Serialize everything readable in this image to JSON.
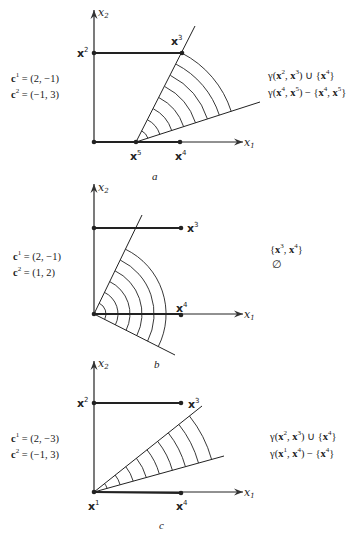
{
  "panels": [
    {
      "id": "a",
      "caption": "a",
      "costs": {
        "c1": "(2, −1)",
        "c2": "(−1, 3)"
      },
      "result_lines": [
        "γ(x², x³) ∪ {x⁴}",
        "γ(x⁴, x⁵) − {x⁴, x⁵}"
      ],
      "points": [
        "x2",
        "x3",
        "x4",
        "x5"
      ],
      "cone_apex": "x5",
      "arc_count": 8
    },
    {
      "id": "b",
      "caption": "b",
      "costs": {
        "c1": "(2, −1)",
        "c2": "(1, 2)"
      },
      "result_lines": [
        "{x³, x⁴}",
        "∅"
      ],
      "points": [
        "x3",
        "x4"
      ],
      "cone_apex": "origin",
      "arc_count": 6
    },
    {
      "id": "c",
      "caption": "c",
      "costs": {
        "c1": "(2, −3)",
        "c2": "(−1, 3)"
      },
      "result_lines": [
        "γ(x², x³) ∪ {x⁴}",
        "γ(x¹, x⁴) − {x⁴}"
      ],
      "points": [
        "x1",
        "x2",
        "x3",
        "x4"
      ],
      "cone_apex": "x1",
      "arc_count": 9
    }
  ],
  "axes": {
    "x_label": "x",
    "x_sub": "1",
    "y_label": "x",
    "y_sub": "2"
  },
  "text": {
    "c": "c",
    "eq": " = ",
    "x": "x",
    "s1": "1",
    "s2": "2",
    "s3": "3",
    "s4": "4",
    "s5": "5",
    "gamma": "γ",
    "a_r1_pre": "γ(",
    "a_r1_mid": ", ",
    "a_r1_post": ") ∪ {",
    "a_r1_end": "}",
    "a_r2_pre": "γ(",
    "a_r2_mid": ", ",
    "a_r2_post": ") − {",
    "a_r2_comma": ", ",
    "a_r2_end": "}",
    "b_r1_pre": "{",
    "b_r1_mid": ", ",
    "b_r1_end": "}",
    "b_r2": "∅",
    "c_r1_pre": "γ(",
    "c_r1_mid": ", ",
    "c_r1_post": ") ∪ {",
    "c_r1_end": "}",
    "c_r2_pre": "γ(",
    "c_r2_mid": ", ",
    "c_r2_post": ") − {",
    "c_r2_end": "}",
    "a_c1": "(2, −1)",
    "a_c2": "(−1, 3)",
    "b_c1": "(2, −1)",
    "b_c2": "(1, 2)",
    "c_c1": "(2, −3)",
    "c_c2": "(−1, 3)"
  }
}
